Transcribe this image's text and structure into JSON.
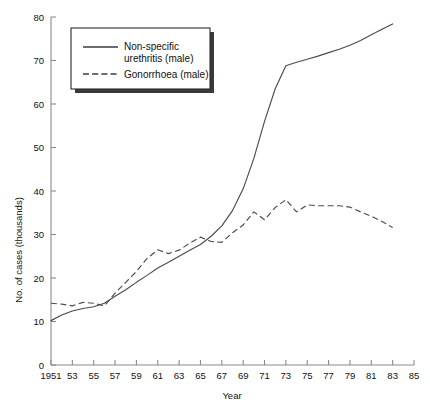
{
  "chart_data": {
    "type": "line",
    "title": "",
    "xlabel": "Year",
    "ylabel": "No. of cases (thousands)",
    "xlim": [
      1951,
      1985
    ],
    "ylim": [
      0,
      80
    ],
    "grid": false,
    "legend_position": "top-left-inside",
    "x_tick_labels": [
      "1951",
      "53",
      "55",
      "57",
      "59",
      "61",
      "63",
      "65",
      "67",
      "69",
      "71",
      "73",
      "75",
      "77",
      "79",
      "81",
      "83",
      "85"
    ],
    "x_tick_values": [
      1951,
      1953,
      1955,
      1957,
      1959,
      1961,
      1963,
      1965,
      1967,
      1969,
      1971,
      1973,
      1975,
      1977,
      1979,
      1981,
      1983,
      1985
    ],
    "y_tick_labels": [
      "0",
      "10",
      "20",
      "30",
      "40",
      "50",
      "60",
      "70",
      "80"
    ],
    "y_tick_values": [
      0,
      10,
      20,
      30,
      40,
      50,
      60,
      70,
      80
    ],
    "x": [
      1951,
      1952,
      1953,
      1954,
      1955,
      1956,
      1957,
      1958,
      1959,
      1960,
      1961,
      1962,
      1963,
      1964,
      1965,
      1966,
      1967,
      1968,
      1969,
      1970,
      1971,
      1972,
      1973,
      1974,
      1975,
      1976,
      1977,
      1978,
      1979,
      1980,
      1981,
      1982,
      1983
    ],
    "series": [
      {
        "name": "Non-specific urethritis (male)",
        "style": "solid",
        "values": [
          10.2,
          11.5,
          12.4,
          13.0,
          13.4,
          14.2,
          15.8,
          17.3,
          19.0,
          20.6,
          22.3,
          23.6,
          25.0,
          26.4,
          27.7,
          29.6,
          32.0,
          35.5,
          40.5,
          47.5,
          56.0,
          63.5,
          68.8,
          69.6,
          70.3,
          71.0,
          71.8,
          72.6,
          73.5,
          74.6,
          75.9,
          77.2,
          78.4
        ]
      },
      {
        "name": "Gonorrhoea (male)",
        "style": "dashed",
        "values": [
          14.2,
          14.0,
          13.6,
          14.4,
          14.2,
          13.6,
          16.5,
          19.0,
          21.5,
          24.5,
          26.5,
          25.6,
          26.4,
          28.0,
          29.4,
          28.4,
          28.2,
          30.4,
          32.2,
          35.2,
          33.4,
          36.2,
          38.0,
          35.2,
          36.8,
          36.6,
          36.6,
          36.6,
          36.3,
          35.2,
          34.2,
          33.0,
          31.6
        ]
      }
    ]
  },
  "legend": {
    "entries": [
      {
        "label_line1": "Non-specific",
        "label_line2": "urethritis (male)",
        "style": "solid"
      },
      {
        "label_line1": "Gonorrhoea (male)",
        "label_line2": "",
        "style": "dashed"
      }
    ]
  }
}
